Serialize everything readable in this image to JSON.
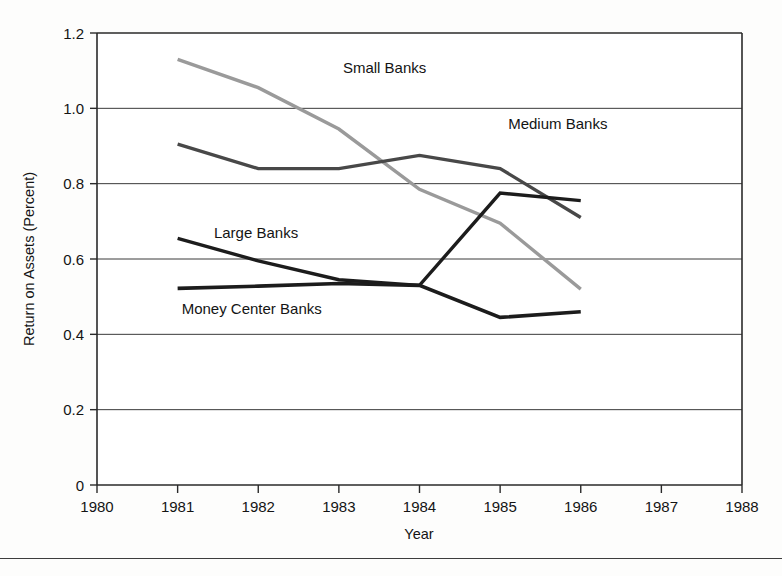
{
  "chart_data": {
    "type": "line",
    "title": "",
    "xlabel": "Year",
    "ylabel": "Return on Assets (Percent)",
    "xlim": [
      1980,
      1988
    ],
    "ylim": [
      0,
      1.2
    ],
    "grid": true,
    "legend": "inline-labels",
    "x_ticks": [
      "1980",
      "1981",
      "1982",
      "1983",
      "1984",
      "1985",
      "1986",
      "1987",
      "1988"
    ],
    "y_ticks": [
      "0",
      "0.2",
      "0.4",
      "0.6",
      "0.8",
      "1.0",
      "1.2"
    ],
    "x": [
      1981,
      1982,
      1983,
      1984,
      1985,
      1986
    ],
    "series": [
      {
        "name": "Small Banks",
        "color": "#9a9a9a",
        "width": 3.4,
        "values": [
          1.13,
          1.055,
          0.945,
          0.785,
          0.695,
          0.52
        ],
        "label_x": 1983.05,
        "label_y": 1.095
      },
      {
        "name": "Medium Banks",
        "color": "#484848",
        "width": 3.4,
        "values": [
          0.905,
          0.84,
          0.84,
          0.875,
          0.84,
          0.71
        ],
        "label_x": 1985.1,
        "label_y": 0.945
      },
      {
        "name": "Large Banks",
        "color": "#1c1c1c",
        "width": 3.4,
        "values": [
          0.655,
          0.595,
          0.545,
          0.53,
          0.775,
          0.755
        ],
        "label_x": 1981.45,
        "label_y": 0.655
      },
      {
        "name": "Money Center Banks",
        "color": "#1c1c1c",
        "width": 3.6,
        "values": [
          0.522,
          0.528,
          0.535,
          0.53,
          0.445,
          0.46
        ],
        "label_x": 1981.05,
        "label_y": 0.455
      }
    ]
  },
  "axes": {
    "y_title": "Return on Assets (Percent)",
    "x_title": "Year"
  }
}
